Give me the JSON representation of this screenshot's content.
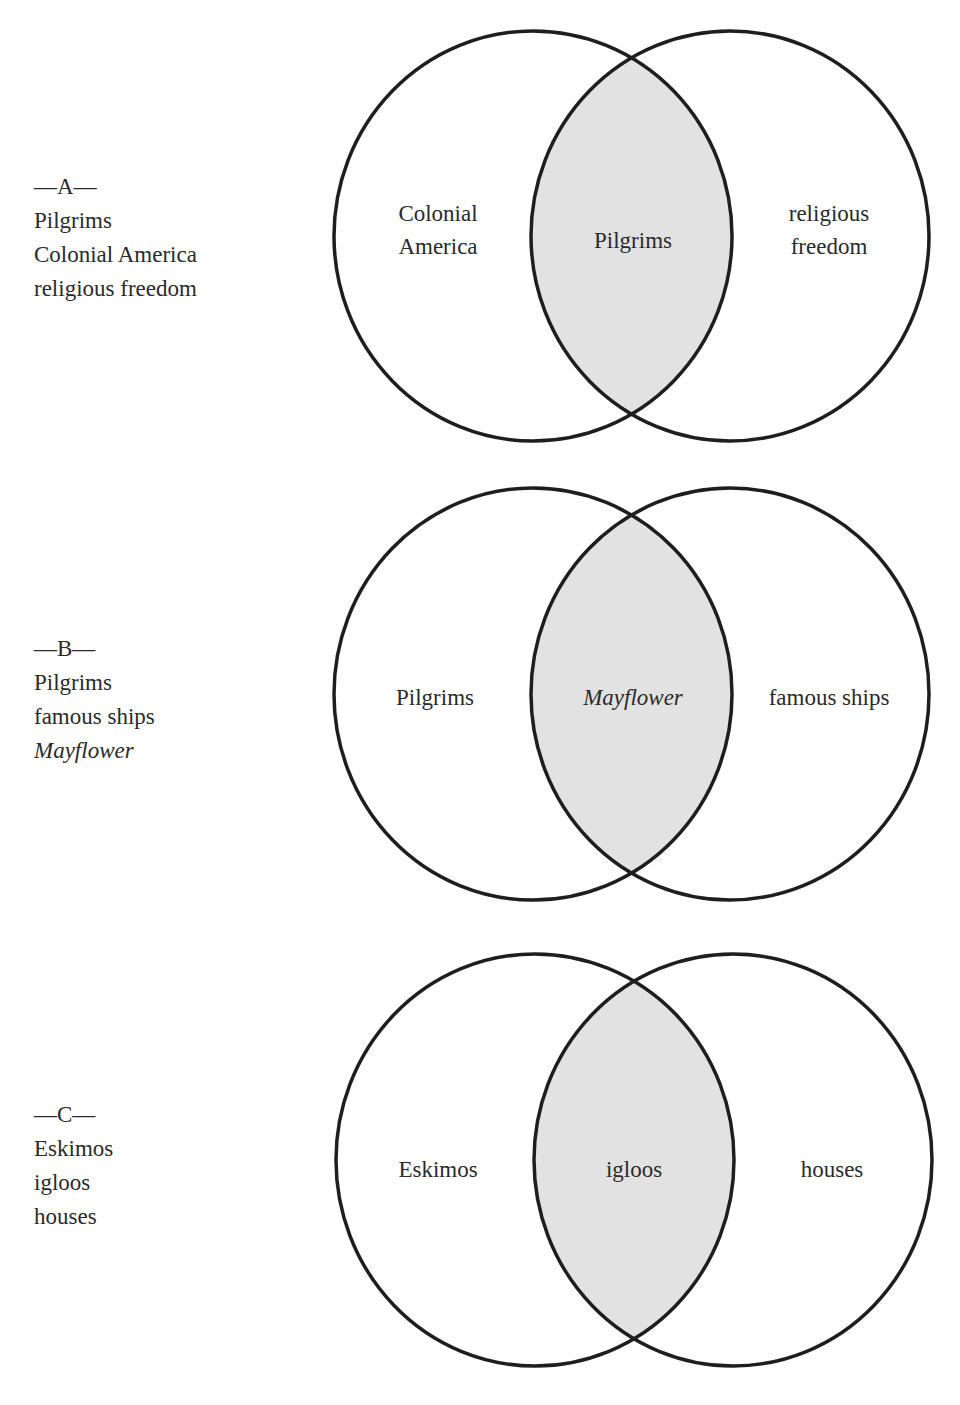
{
  "colors": {
    "stroke": "#1e1e1e",
    "overlap_fill": "#e2e2e2",
    "background": "#ffffff",
    "text": "#2a2a2a"
  },
  "diagrams": [
    {
      "id": "A",
      "legend": {
        "heading": "—A—",
        "items": [
          "Pilgrims",
          "Colonial America",
          "religious freedom"
        ]
      },
      "left_label_line1": "Colonial",
      "left_label_line2": "America",
      "center_label": "Pilgrims",
      "right_label_line1": "religious",
      "right_label_line2": "freedom"
    },
    {
      "id": "B",
      "legend": {
        "heading": "—B—",
        "items": [
          "Pilgrims",
          "famous ships",
          "Mayflower"
        ]
      },
      "left_label": "Pilgrims",
      "center_label": "Mayflower",
      "right_label": "famous ships"
    },
    {
      "id": "C",
      "legend": {
        "heading": "—C—",
        "items": [
          "Eskimos",
          "igloos",
          "houses"
        ]
      },
      "left_label": "Eskimos",
      "center_label": "igloos",
      "right_label": "houses"
    }
  ]
}
